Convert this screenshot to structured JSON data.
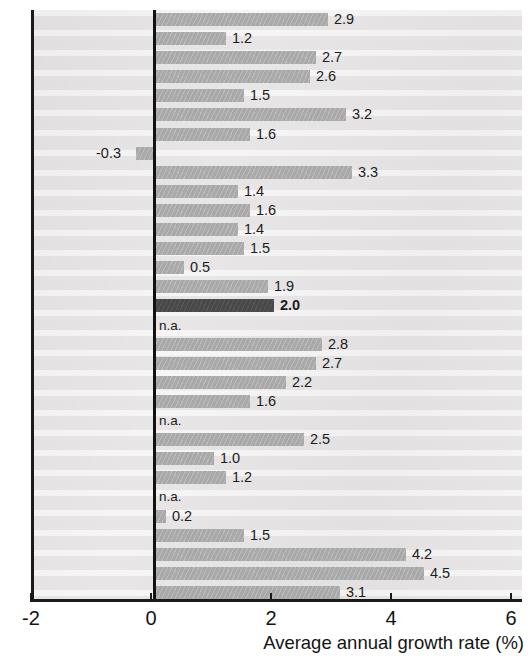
{
  "chart_data": {
    "type": "bar",
    "orientation": "horizontal",
    "title": "",
    "subtitle": "",
    "xlabel": "Average annual growth rate (%)",
    "ylabel": "",
    "xlim": [
      -2,
      6
    ],
    "xticks": [
      -2,
      0,
      2,
      4,
      6
    ],
    "xtick_labels": [
      "-2",
      "0",
      "2",
      "4",
      "6"
    ],
    "yticks_visible": true,
    "ytick_labels_visible": false,
    "grid": false,
    "legend": null,
    "zero_line": 0,
    "n_categories": 31,
    "categories": [
      "",
      "",
      "",
      "",
      "",
      "",
      "",
      "",
      "",
      "",
      "",
      "",
      "",
      "",
      "",
      "",
      "",
      "",
      "",
      "",
      "",
      "",
      "",
      "",
      "",
      "",
      "",
      "",
      "",
      "",
      ""
    ],
    "values": [
      2.9,
      1.2,
      2.7,
      2.6,
      1.5,
      3.2,
      1.6,
      -0.3,
      3.3,
      1.4,
      1.6,
      1.4,
      1.5,
      0.5,
      1.9,
      2.0,
      null,
      2.8,
      2.7,
      2.2,
      1.6,
      null,
      2.5,
      1.0,
      1.2,
      null,
      0.2,
      1.5,
      4.2,
      4.5,
      3.1
    ],
    "value_labels": [
      "2.9",
      "1.2",
      "2.7",
      "2.6",
      "1.5",
      "3.2",
      "1.6",
      "-0.3",
      "3.3",
      "1.4",
      "1.6",
      "1.4",
      "1.5",
      "0.5",
      "1.9",
      "2.0",
      "n.a.",
      "2.8",
      "2.7",
      "2.2",
      "1.6",
      "n.a.",
      "2.5",
      "1.0",
      "1.2",
      "n.a.",
      "0.2",
      "1.5",
      "4.2",
      "4.5",
      "3.1"
    ],
    "highlighted_index": 15,
    "missing_label": "n.a.",
    "colors": {
      "bar": "#a9a9a9",
      "bar_highlight": "#494949",
      "plot_background": "#eceaea",
      "axis": "#1a1a1a",
      "text": "#141414"
    }
  },
  "axis": {
    "x_title": "Average annual growth rate (%)",
    "tick_labels": [
      "-2",
      "0",
      "2",
      "4",
      "6"
    ]
  }
}
